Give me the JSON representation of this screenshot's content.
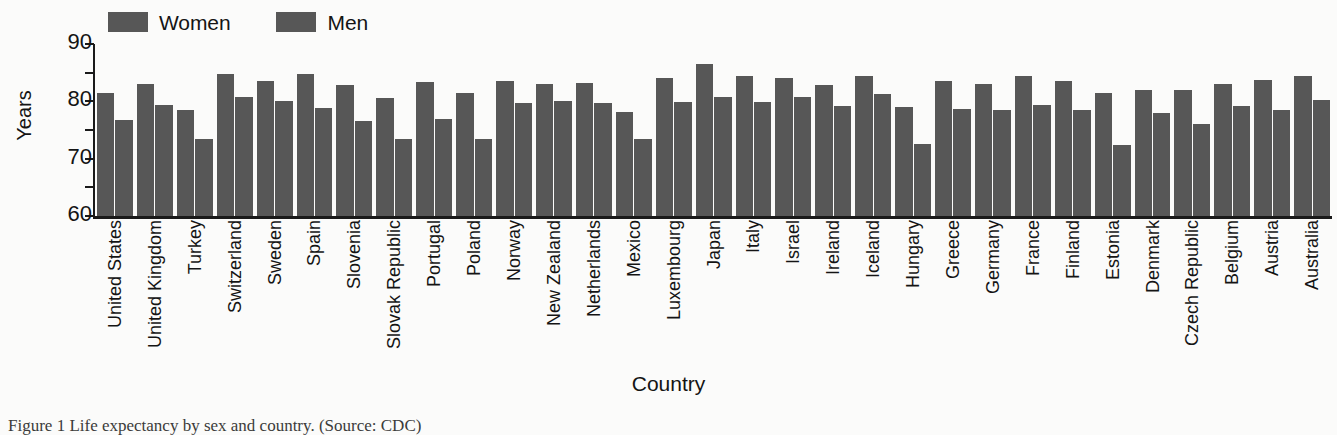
{
  "legend": {
    "entries": [
      {
        "label": "Women",
        "color": "#575757",
        "swatch_icon": "legend-swatch-icon"
      },
      {
        "label": "Men",
        "color": "#575757",
        "swatch_icon": "legend-swatch-icon"
      }
    ]
  },
  "axes": {
    "y_title": "Years",
    "x_title": "Country",
    "y_tick_labels": [
      "90",
      "80",
      "70",
      "60"
    ],
    "y_minor_ticks": [
      "85",
      "75",
      "65"
    ]
  },
  "caption": {
    "text": "Figure 1 Life expectancy by sex and country. (Source: CDC)"
  },
  "chart_data": {
    "type": "bar",
    "title": "",
    "subtitle": "",
    "xlabel": "Country",
    "ylabel": "Years",
    "ylim": [
      60,
      90
    ],
    "ytick_interval": 5,
    "ytick_labeled_interval": 10,
    "grid": false,
    "legend_position": "top-left",
    "orientation": "vertical",
    "grouping": "grouped",
    "bar_color": "#575757",
    "categories": [
      "United States",
      "United Kingdom",
      "Turkey",
      "Switzerland",
      "Sweden",
      "Spain",
      "Slovenia",
      "Slovak Republic",
      "Portugal",
      "Poland",
      "Norway",
      "New Zealand",
      "Netherlands",
      "Mexico",
      "Luxembourg",
      "Japan",
      "Italy",
      "Israel",
      "Ireland",
      "Iceland",
      "Hungary",
      "Greece",
      "Germany",
      "France",
      "Finland",
      "Estonia",
      "Denmark",
      "Czech Republic",
      "Belgium",
      "Austria",
      "Australia"
    ],
    "series": [
      {
        "name": "Women",
        "color": "#575757",
        "values": [
          81.5,
          83.0,
          78.5,
          84.8,
          83.5,
          84.8,
          82.8,
          80.5,
          83.3,
          81.5,
          83.5,
          83.0,
          83.2,
          78.2,
          84.0,
          86.5,
          84.5,
          84.0,
          82.8,
          84.5,
          79.0,
          83.5,
          83.0,
          84.5,
          83.5,
          81.5,
          82.0,
          82.0,
          83.0,
          83.8,
          84.5
        ]
      },
      {
        "name": "Men",
        "color": "#575757",
        "values": [
          76.8,
          79.3,
          73.5,
          80.8,
          80.0,
          78.8,
          76.5,
          73.5,
          77.0,
          73.5,
          79.7,
          80.0,
          79.7,
          73.5,
          79.8,
          80.8,
          79.8,
          80.8,
          79.2,
          81.2,
          72.5,
          78.6,
          78.5,
          79.3,
          78.5,
          72.3,
          78.0,
          76.0,
          79.2,
          78.5,
          80.3
        ]
      }
    ]
  }
}
